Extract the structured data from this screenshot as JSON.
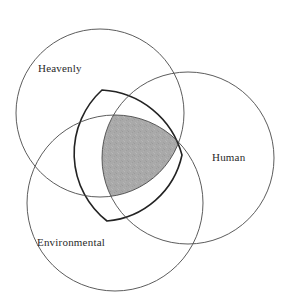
{
  "diagram": {
    "type": "venn",
    "title": "",
    "background_color": "#ffffff",
    "circle_stroke_color": "#4a4a4a",
    "intersection_fill_color": "#a9a9a9",
    "intersection_stroke_color": "#232323",
    "label_color": "#2a2a2a",
    "sets": [
      {
        "id": "heavenly",
        "label": "Heavenly",
        "label_x": 38,
        "label_y": 69,
        "cx": 100,
        "cy": 113,
        "r": 84
      },
      {
        "id": "human",
        "label": "Human",
        "label_x": 212,
        "label_y": 158,
        "cx": 188,
        "cy": 158,
        "r": 86
      },
      {
        "id": "environmental",
        "label": "Environmental",
        "label_x": 37,
        "label_y": 243,
        "cx": 115,
        "cy": 203,
        "r": 88
      }
    ],
    "intersection": {
      "id": "triple-intersection",
      "label": "",
      "shaded": true,
      "vertices": [
        {
          "x": 102,
          "y": 90
        },
        {
          "x": 182,
          "y": 155
        },
        {
          "x": 107,
          "y": 221
        }
      ]
    }
  }
}
